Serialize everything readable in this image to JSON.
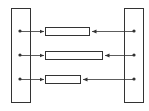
{
  "diagram": {
    "type": "connection-diagram",
    "left_block": {
      "label": ""
    },
    "right_block": {
      "label": ""
    },
    "connections": [
      {
        "id": "row-1",
        "box_label": "",
        "relative_box_length": "medium"
      },
      {
        "id": "row-2",
        "box_label": "",
        "relative_box_length": "long"
      },
      {
        "id": "row-3",
        "box_label": "",
        "relative_box_length": "short"
      }
    ],
    "colors": {
      "stroke": "#333333",
      "fill": "#ffffff",
      "background": "#ffffff"
    }
  }
}
